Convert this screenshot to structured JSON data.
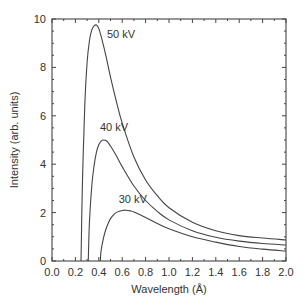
{
  "chart_data": {
    "type": "line",
    "title": "",
    "xlabel": "Wavelength (Å)",
    "ylabel": "Intensity (arb. units)",
    "xlim": [
      0.0,
      2.0
    ],
    "ylim": [
      0,
      10
    ],
    "x_ticks": [
      "0.0",
      "0.2",
      "0.4",
      "0.6",
      "0.8",
      "1.0",
      "1.2",
      "1.4",
      "1.6",
      "1.8",
      "2.0"
    ],
    "y_ticks": [
      "0",
      "2",
      "4",
      "6",
      "8",
      "10"
    ],
    "grid": false,
    "legend": "none (curves labeled inline)",
    "series": [
      {
        "name": "50 kV",
        "label_pos": [
          0.47,
          9.4
        ],
        "x": [
          0.248,
          0.26,
          0.28,
          0.3,
          0.32,
          0.34,
          0.36,
          0.38,
          0.4,
          0.43,
          0.46,
          0.5,
          0.55,
          0.6,
          0.7,
          0.8,
          0.9,
          1.0,
          1.2,
          1.4,
          1.6,
          1.8,
          2.0
        ],
        "y": [
          0.0,
          3.2,
          6.4,
          8.2,
          9.1,
          9.55,
          9.72,
          9.75,
          9.6,
          9.1,
          8.5,
          7.6,
          6.6,
          5.7,
          4.3,
          3.35,
          2.7,
          2.2,
          1.6,
          1.25,
          1.05,
          0.95,
          0.87
        ]
      },
      {
        "name": "40 kV",
        "label_pos": [
          0.41,
          5.55
        ],
        "x": [
          0.31,
          0.32,
          0.34,
          0.36,
          0.38,
          0.4,
          0.42,
          0.44,
          0.47,
          0.5,
          0.55,
          0.6,
          0.7,
          0.8,
          0.9,
          1.0,
          1.2,
          1.4,
          1.6,
          1.8,
          2.0
        ],
        "y": [
          0.0,
          1.6,
          3.1,
          3.95,
          4.5,
          4.8,
          4.95,
          5.0,
          4.95,
          4.75,
          4.35,
          3.9,
          3.1,
          2.5,
          2.05,
          1.7,
          1.25,
          0.98,
          0.82,
          0.72,
          0.66
        ]
      },
      {
        "name": "30 kV",
        "label_pos": [
          0.57,
          2.55
        ],
        "x": [
          0.413,
          0.42,
          0.44,
          0.46,
          0.48,
          0.5,
          0.53,
          0.56,
          0.6,
          0.63,
          0.67,
          0.7,
          0.8,
          0.9,
          1.0,
          1.2,
          1.4,
          1.6,
          1.8,
          2.0
        ],
        "y": [
          0.0,
          0.45,
          0.95,
          1.3,
          1.55,
          1.75,
          1.93,
          2.03,
          2.09,
          2.1,
          2.07,
          2.02,
          1.8,
          1.55,
          1.33,
          1.0,
          0.78,
          0.6,
          0.49,
          0.41
        ]
      }
    ]
  },
  "layout": {
    "plot": {
      "left": 52,
      "right": 286,
      "top": 19,
      "bottom": 261
    },
    "line_color": "#444444",
    "text_color": "#333333"
  }
}
